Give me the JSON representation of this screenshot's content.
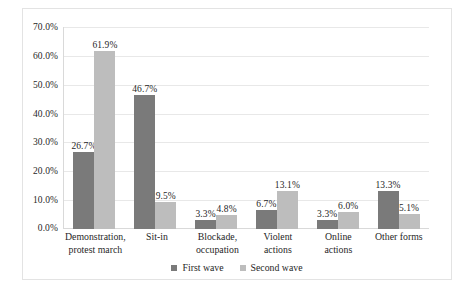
{
  "chart_data": {
    "type": "bar",
    "title": "",
    "subtitle": "",
    "xlabel": "",
    "ylabel": "",
    "ylim": [
      0,
      70
    ],
    "ytick_values": [
      70,
      60,
      50,
      40,
      30,
      20,
      10,
      0
    ],
    "ytick_labels": [
      "70.0%",
      "60.0%",
      "50.0%",
      "40.0%",
      "30.0%",
      "20.0%",
      "10.0%",
      "0.0%"
    ],
    "grid": true,
    "legend_position": "bottom-center",
    "categories": [
      "Demonstration, protest march",
      "Sit-in",
      "Blockade, occupation",
      "Violent actions",
      "Online actions",
      "Other forms"
    ],
    "category_lines": [
      [
        "Demonstration,",
        "protest march"
      ],
      [
        "Sit-in",
        ""
      ],
      [
        "Blockade,",
        "occupation"
      ],
      [
        "Violent",
        "actions"
      ],
      [
        "Online",
        "actions"
      ],
      [
        "Other forms",
        ""
      ]
    ],
    "series": [
      {
        "name": "First wave",
        "color": "#7a7a7a",
        "values": [
          26.7,
          46.7,
          3.3,
          6.7,
          3.3,
          13.3
        ],
        "labels": [
          "26.7%",
          "46.7%",
          "3.3%",
          "6.7%",
          "3.3%",
          "13.3%"
        ]
      },
      {
        "name": "Second wave",
        "color": "#bdbdbd",
        "values": [
          61.9,
          9.5,
          4.8,
          13.1,
          6.0,
          5.1
        ],
        "labels": [
          "61.9%",
          "9.5%",
          "4.8%",
          "13.1%",
          "6.0%",
          "5.1%"
        ]
      }
    ]
  },
  "colors": {
    "first_wave": "#7a7a7a",
    "second_wave": "#bdbdbd",
    "gridline": "#e8e8e8",
    "frame_border": "#e3e3e3",
    "text": "#1f1f1f",
    "background": "#ffffff"
  }
}
